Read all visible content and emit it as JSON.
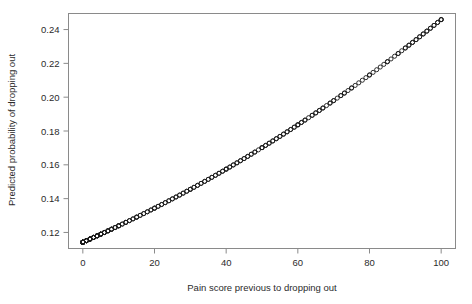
{
  "chart_data": {
    "type": "scatter",
    "title": "",
    "subtitle": "",
    "xlabel": "Pain score previous to dropping out",
    "ylabel": "Predicted probability of dropping out",
    "xlim": [
      -4,
      104
    ],
    "ylim": [
      0.1105,
      0.2495
    ],
    "xticks": [
      0,
      20,
      40,
      60,
      80,
      100
    ],
    "xticklabels": [
      "0",
      "20",
      "40",
      "60",
      "80",
      "100"
    ],
    "yticks": [
      0.12,
      0.14,
      0.16,
      0.18,
      0.2,
      0.22,
      0.24
    ],
    "yticklabels": [
      "0.12",
      "0.14",
      "0.16",
      "0.18",
      "0.20",
      "0.22",
      "0.24"
    ],
    "grid": false,
    "legend": false,
    "legend_position": "none",
    "marker": "open-circle",
    "marker_size": 4,
    "marker_color": "#1a1a1a",
    "frame_color": "#8a8a8a",
    "background": "#ffffff",
    "series": [
      {
        "name": "Predicted probability",
        "x": [
          0,
          0,
          0,
          0,
          0,
          0,
          0,
          0,
          0,
          0,
          0,
          0,
          0,
          0,
          0,
          0,
          0,
          0,
          0,
          0,
          1,
          1,
          1,
          1,
          1,
          1,
          1,
          1,
          2,
          2,
          2,
          2,
          2,
          2,
          2,
          2,
          2,
          2,
          3,
          3,
          3,
          3,
          3,
          3,
          4,
          4,
          4,
          4,
          4,
          4,
          5,
          5,
          5,
          5,
          5,
          5,
          6,
          6,
          6,
          6,
          7,
          7,
          7,
          7,
          8,
          8,
          8,
          8,
          9,
          9,
          9,
          10,
          10,
          10,
          10,
          11,
          11,
          12,
          12,
          12,
          13,
          13,
          14,
          14,
          15,
          15,
          15,
          16,
          16,
          17,
          17,
          18,
          18,
          19,
          19,
          20,
          20,
          20,
          21,
          21,
          22,
          22,
          23,
          23,
          24,
          24,
          25,
          25,
          26,
          26,
          27,
          27,
          28,
          28,
          29,
          29,
          30,
          30,
          30,
          31,
          31,
          32,
          32,
          33,
          33,
          34,
          34,
          35,
          35,
          36,
          36,
          37,
          37,
          38,
          38,
          39,
          39,
          40,
          40,
          40,
          41,
          41,
          42,
          42,
          43,
          43,
          44,
          44,
          45,
          45,
          46,
          46,
          47,
          47,
          48,
          48,
          49,
          50,
          50,
          50,
          51,
          51,
          52,
          52,
          53,
          53,
          54,
          54,
          55,
          55,
          56,
          56,
          57,
          57,
          58,
          58,
          59,
          59,
          60,
          60,
          60,
          61,
          61,
          62,
          62,
          63,
          64,
          64,
          65,
          65,
          66,
          66,
          67,
          67,
          68,
          69,
          69,
          70,
          70,
          71,
          72,
          72,
          73,
          73,
          74,
          75,
          75,
          76,
          77,
          78,
          79,
          80,
          80,
          81,
          82,
          83,
          84,
          85,
          85,
          86,
          87,
          88,
          88,
          89,
          90,
          90,
          91,
          91,
          92,
          92,
          93,
          93,
          94,
          94,
          95,
          95,
          96,
          96,
          97,
          97,
          98,
          98,
          99,
          99,
          100,
          100,
          100
        ],
        "y_formula": "logistic: p = 1/(1+exp(-(b0 + b1*x))) with b0 = -2.049, b1 = 0.01235",
        "y_start": 0.1142,
        "y_end": 0.2459
      }
    ],
    "annotations": []
  },
  "meta": {
    "x_start_value": 0,
    "x_end_value": 100,
    "y_min_observed": 0.114,
    "y_max_observed": 0.246,
    "n_points_approx": 250,
    "shape": "monotonically increasing, slightly convex"
  }
}
